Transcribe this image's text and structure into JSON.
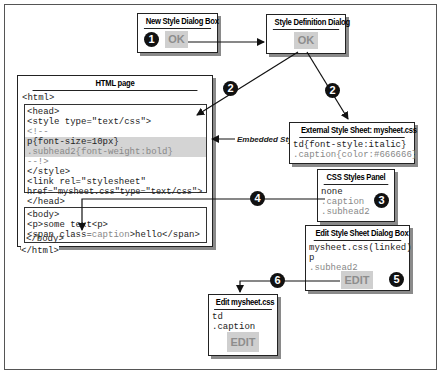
{
  "new_style_dialog": {
    "title": "New Style Dialog Box",
    "button": "OK",
    "step": "1"
  },
  "style_definition_dialog": {
    "title": "Style Definition Dialog",
    "button": "OK",
    "step": "2"
  },
  "html_page": {
    "title": "HTML page",
    "open_tag": "<html>",
    "head_lines": [
      "<head>",
      "<style type=\"text/css\">",
      "<!--"
    ],
    "embedded_lines": [
      "p{font-size=10px}",
      ".subhead2{font-weight:bold}"
    ],
    "head_tail_lines": [
      "--!>",
      "</style>",
      "<link rel=\"stylesheet\"",
      "href=\"mysheet.css\"type=\"text/css\">",
      "</head>"
    ],
    "body_lines": [
      "<body>",
      "<p>some text<p>"
    ],
    "span_prefix": "<span class=",
    "span_class": "caption",
    "span_suffix": ">hello</span>",
    "body_close": "</body>",
    "close_tag": "</html>"
  },
  "embedded_styles_label": "Embedded Styles",
  "external_sheet": {
    "title": "External Style Sheet: mysheet.css",
    "lines": [
      "td{font-style:italic}",
      ".caption{color:#666666}"
    ],
    "step": "2"
  },
  "css_styles_panel": {
    "title": "CSS Styles Panel",
    "items": [
      "none",
      ".caption",
      ".subhead2"
    ],
    "step": "3"
  },
  "step4": "4",
  "edit_style_sheet_dialog": {
    "title": "Edit Style Sheet Dialog Box",
    "items": [
      "mysheet.css(linked)",
      "p",
      ".subhead2"
    ],
    "button": "EDIT",
    "step": "5"
  },
  "step6": "6",
  "edit_mysheet": {
    "title": "Edit mysheet.css",
    "items": [
      "td",
      ".caption"
    ],
    "button": "EDIT"
  }
}
